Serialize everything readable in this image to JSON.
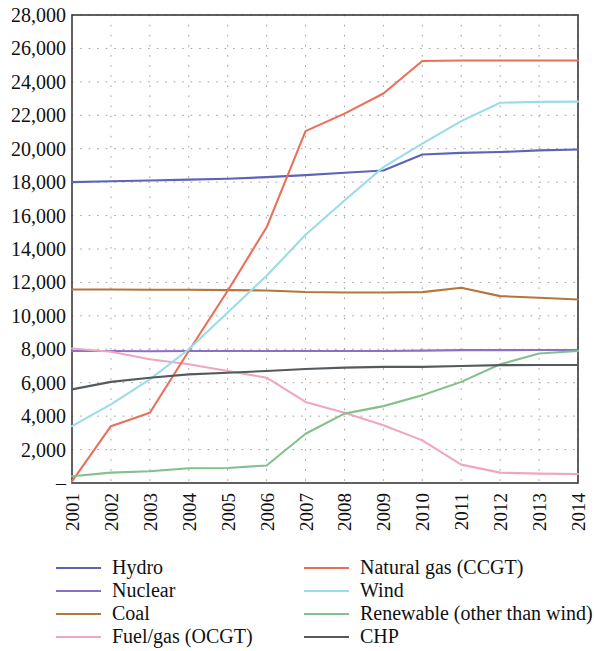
{
  "chart_data": {
    "type": "line",
    "title": "",
    "xlabel": "",
    "ylabel": "",
    "x": [
      2001,
      2002,
      2003,
      2004,
      2005,
      2006,
      2007,
      2008,
      2009,
      2010,
      2011,
      2012,
      2013,
      2014
    ],
    "xtick_labels": [
      "2001",
      "2002",
      "2003",
      "2004",
      "2005",
      "2006",
      "2007",
      "2008",
      "2009",
      "2010",
      "2011",
      "2012",
      "2013",
      "2014"
    ],
    "ytick_labels": [
      "–",
      "2,000",
      "4,000",
      "6,000",
      "8,000",
      "10,000",
      "12,000",
      "14,000",
      "16,000",
      "18,000",
      "20,000",
      "22,000",
      "24,000",
      "26,000",
      "28,000"
    ],
    "ytick_values": [
      0,
      2000,
      4000,
      6000,
      8000,
      10000,
      12000,
      14000,
      16000,
      18000,
      20000,
      22000,
      24000,
      26000,
      28000
    ],
    "ylim": [
      0,
      28000
    ],
    "xlim": [
      2001,
      2014
    ],
    "grid": "dotted",
    "legend_position": "bottom",
    "legend_columns": 2,
    "series": [
      {
        "name": "Hydro",
        "color": "#5c63b8",
        "values": [
          18000,
          18050,
          18100,
          18150,
          18200,
          18300,
          18420,
          18560,
          18700,
          19650,
          19750,
          19800,
          19900,
          19950
        ]
      },
      {
        "name": "Nuclear",
        "color": "#8b6fcf",
        "values": [
          7900,
          7900,
          7880,
          7900,
          7900,
          7900,
          7900,
          7900,
          7900,
          7920,
          7950,
          7950,
          7960,
          7960
        ]
      },
      {
        "name": "Coal",
        "color": "#b5763a",
        "values": [
          11580,
          11580,
          11560,
          11560,
          11540,
          11520,
          11430,
          11400,
          11400,
          11420,
          11680,
          11180,
          11080,
          10980
        ]
      },
      {
        "name": "Fuel/gas (OCGT)",
        "color": "#f0a7bd",
        "values": [
          8050,
          7850,
          7400,
          7100,
          6700,
          6300,
          4850,
          4200,
          3450,
          2550,
          1100,
          620,
          560,
          540
        ]
      },
      {
        "name": "Natural gas (CCGT)",
        "color": "#ea6f5a",
        "values": [
          100,
          3400,
          4200,
          7900,
          11500,
          15300,
          21050,
          22100,
          23300,
          25250,
          25280,
          25280,
          25280,
          25280
        ]
      },
      {
        "name": "Wind",
        "color": "#9adce8",
        "values": [
          3400,
          4700,
          6200,
          8000,
          10200,
          12400,
          14850,
          16900,
          18900,
          20300,
          21650,
          22750,
          22800,
          22820
        ]
      },
      {
        "name": "Renewable (other than wind)",
        "color": "#84c08c",
        "values": [
          400,
          620,
          700,
          880,
          900,
          1050,
          2950,
          4150,
          4600,
          5250,
          6050,
          7100,
          7750,
          7900
        ]
      },
      {
        "name": "CHP",
        "color": "#555a5e",
        "values": [
          5600,
          6050,
          6300,
          6500,
          6600,
          6700,
          6820,
          6900,
          6950,
          6950,
          7000,
          7050,
          7060,
          7060
        ]
      }
    ]
  },
  "legend": {
    "columns": [
      {
        "items": [
          {
            "label": "Hydro",
            "color": "#5c63b8",
            "name": "hydro"
          },
          {
            "label": "Nuclear",
            "color": "#8b6fcf",
            "name": "nuclear"
          },
          {
            "label": "Coal",
            "color": "#b5763a",
            "name": "coal"
          },
          {
            "label": "Fuel/gas (OCGT)",
            "color": "#f0a7bd",
            "name": "fuel-gas-ocgt"
          }
        ]
      },
      {
        "items": [
          {
            "label": "Natural gas (CCGT)",
            "color": "#ea6f5a",
            "name": "natural-gas-ccgt"
          },
          {
            "label": "Wind",
            "color": "#9adce8",
            "name": "wind"
          },
          {
            "label": "Renewable (other than wind)",
            "color": "#84c08c",
            "name": "renewable-other-than-wind"
          },
          {
            "label": "CHP",
            "color": "#555a5e",
            "name": "chp"
          }
        ]
      }
    ]
  }
}
